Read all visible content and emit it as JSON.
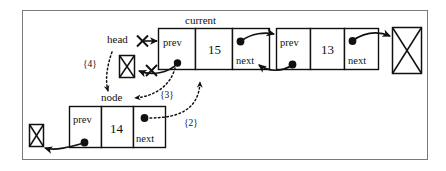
{
  "diagram": {
    "pointer_labels": {
      "head": "head",
      "current": "current",
      "node": "node"
    },
    "steps": [
      {
        "id": "step-2",
        "label": "{2}"
      },
      {
        "id": "step-3",
        "label": "{3}"
      },
      {
        "id": "step-4",
        "label": "{4}"
      }
    ],
    "field_names": {
      "prev": "prev",
      "next": "next"
    },
    "nodes": [
      {
        "name": "current-node",
        "value": "15",
        "prev_label": "prev",
        "next_label": "next"
      },
      {
        "name": "tail-node",
        "value": "13",
        "prev_label": "prev",
        "next_label": "next"
      },
      {
        "name": "new-node",
        "value": "14",
        "prev_label": "prev",
        "next_label": "next"
      }
    ],
    "null_markers": [
      {
        "name": "null-marker-head-left"
      },
      {
        "name": "null-marker-tail-right"
      },
      {
        "name": "null-marker-new-node-left"
      }
    ],
    "colors": {
      "ink": "#111111",
      "frame": "#7a7a7a",
      "background": "#ffffff"
    }
  }
}
